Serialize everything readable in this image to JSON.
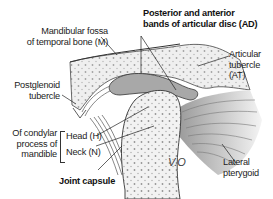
{
  "diagram": {
    "title_label": {
      "line1": "Posterior and anterior",
      "line2": "bands of articular disc (AD)"
    },
    "labels": {
      "mandibular_fossa": {
        "line1": "Mandibular fossa",
        "line2": "of temporal bone (M)"
      },
      "articular_tubercle": {
        "line1": "Articular",
        "line2": "tubercle (AT)"
      },
      "postglenoid_tubercle": {
        "line1": "Postglenoid",
        "line2": "tubercle"
      },
      "condylar_process": {
        "line1": "Of condylar",
        "line2": "process of",
        "line3": "mandible"
      },
      "head": "Head (H)",
      "neck": "Neck (N)",
      "joint_capsule": "Joint capsule",
      "lateral_pterygoid": {
        "line1": "Lateral",
        "line2": "pterygoid"
      }
    },
    "signature": "V.O",
    "colors": {
      "bone_fill": "#ececec",
      "disc_fill": "#a9a9a9",
      "muscle_fill": "#b8b8b8",
      "line": "#333333"
    }
  }
}
